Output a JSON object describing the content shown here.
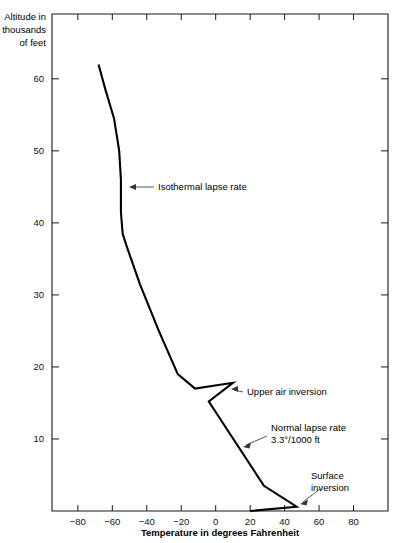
{
  "chart_data": {
    "type": "line",
    "title": "",
    "subtitle": "",
    "xlabel": "Temperature in degrees Fahrenheit",
    "ylabel": "Altitude in thousands of feet",
    "ylabel_lines": [
      "Altitude in",
      "thousands",
      "of feet"
    ],
    "xlim": [
      -95,
      100
    ],
    "ylim": [
      0,
      69
    ],
    "grid": false,
    "legend": "none",
    "xticks": [
      -80,
      -60,
      -40,
      -20,
      0,
      20,
      40,
      60,
      80
    ],
    "xticklabels": [
      "−80",
      "−60",
      "−40",
      "−20",
      "0",
      "20",
      "40",
      "60",
      "80"
    ],
    "yticks": [
      10,
      20,
      30,
      40,
      50,
      60
    ],
    "yticklabels": [
      "10",
      "20",
      "30",
      "40",
      "50",
      "60"
    ],
    "series": [
      {
        "name": "Standard atmosphere temperature profile",
        "comment": "x = temperature (deg F), y = altitude (thousands of feet), ordered from top of atmosphere down to ground",
        "points": [
          [
            -68,
            62.0
          ],
          [
            -64,
            58.5
          ],
          [
            -59,
            54.5
          ],
          [
            -56,
            50.0
          ],
          [
            -55,
            46.0
          ],
          [
            -55,
            41.5
          ],
          [
            -54,
            38.5
          ],
          [
            -52,
            37.0
          ],
          [
            -44,
            31.5
          ],
          [
            -33,
            25.0
          ],
          [
            -22,
            19.0
          ],
          [
            -12,
            17.0
          ],
          [
            10,
            17.8
          ],
          [
            -4,
            15.2
          ],
          [
            28,
            3.5
          ],
          [
            47,
            0.6
          ],
          [
            20,
            0.0
          ]
        ]
      }
    ],
    "annotations": [
      {
        "id": "isothermal",
        "label_lines": [
          "Isothermal lapse rate"
        ],
        "text_x": 158,
        "text_y": 190,
        "leader": [
          [
            154,
            187
          ],
          [
            131,
            187
          ]
        ],
        "arrow_at": [
          129,
          187
        ],
        "arrow_dir": "left"
      },
      {
        "id": "upper-air-inversion",
        "label_lines": [
          "Upper air inversion"
        ],
        "text_x": 247,
        "text_y": 395,
        "leader": [
          [
            243,
            392
          ],
          [
            234,
            390
          ]
        ],
        "arrow_at": [
          231,
          389
        ],
        "arrow_dir": "left"
      },
      {
        "id": "normal-lapse-rate",
        "label_lines": [
          "Normal lapse rate",
          "3.3°/1000 ft"
        ],
        "text_x": 271,
        "text_y": 431,
        "leader": [
          [
            267,
            436
          ],
          [
            246,
            445
          ]
        ],
        "arrow_at": [
          243,
          447
        ],
        "arrow_dir": "left-down"
      },
      {
        "id": "surface-inversion",
        "label_lines": [
          "Surface",
          "inversion"
        ],
        "text_x": 311,
        "text_y": 479,
        "leader": [
          [
            320,
            489
          ],
          [
            303,
            502
          ]
        ],
        "arrow_at": [
          300,
          504
        ],
        "arrow_dir": "left-down"
      }
    ],
    "plot_box": {
      "left": 52,
      "top": 14,
      "right": 388,
      "bottom": 511
    }
  }
}
